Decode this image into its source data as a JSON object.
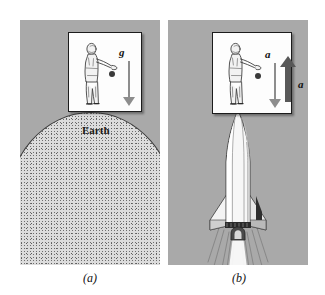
{
  "figure": {
    "panels": [
      {
        "id": "a",
        "caption": "(a)",
        "ground_label": "Earth",
        "arrow_label": "g",
        "arrow_direction": "down",
        "scene": "person-in-closed-box-on-earth-releasing-ball"
      },
      {
        "id": "b",
        "caption": "(b)",
        "arrow_label_inside": "a",
        "arrow_direction_inside": "down",
        "arrow_label_outside": "a",
        "arrow_direction_outside": "up",
        "scene": "person-in-closed-box-on-accelerating-rocket-releasing-ball"
      }
    ],
    "colors": {
      "panel_background": "#a9a9a9",
      "box_fill": "#fdfdfd",
      "box_border": "#1c1c1c",
      "ball": "#3a3a3a",
      "inner_arrow": "#8d8d8d",
      "outer_arrow": "#585858",
      "earth_fill": "#dcdcdc",
      "earth_outline": "#3b3b3b",
      "page_background": "#ffffff"
    }
  }
}
